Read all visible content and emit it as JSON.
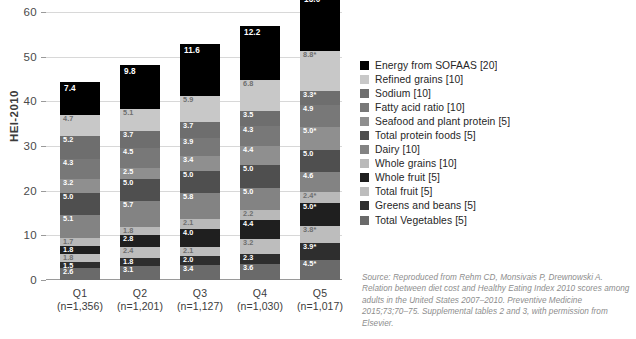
{
  "chart_data": {
    "type": "bar",
    "subtype": "stacked-bar",
    "title": "",
    "xlabel": "",
    "ylabel": "HEI-2010",
    "ylim": [
      0,
      60
    ],
    "yticks": [
      0,
      10,
      20,
      30,
      40,
      50,
      60
    ],
    "grid": true,
    "legend_position": "right",
    "categories": [
      "Q1",
      "Q2",
      "Q3",
      "Q4",
      "Q5"
    ],
    "category_sublabels": [
      "(n=1,356)",
      "(n=1,201)",
      "(n=1,127)",
      "(n=1,030)",
      "(n=1,017)"
    ],
    "stack_order_bottom_to_top": [
      "Total Vegetables [5]",
      "Greens and beans [5]",
      "Total fruit [5]",
      "Whole fruit [5]",
      "Whole grains [10]",
      "Dairy [10]",
      "Total protein foods [5]",
      "Seafood and plant protein [5]",
      "Fatty acid ratio [10]",
      "Sodium [10]",
      "Refined grains [10]",
      "Energy from SOFAAS [20]"
    ],
    "series": [
      {
        "name": "Energy from SOFAAS [20]",
        "color": "#000000",
        "values": [
          7.4,
          9.8,
          11.6,
          12.2,
          13.0
        ],
        "labels": [
          "7.4",
          "9.8",
          "11.6",
          "12.2",
          "13.0*"
        ]
      },
      {
        "name": "Refined grains [10]",
        "color": "#c8c8c8",
        "values": [
          4.7,
          5.1,
          5.9,
          6.8,
          8.8
        ],
        "labels": [
          "4.7",
          "5.1",
          "5.9",
          "6.8",
          "8.8*"
        ]
      },
      {
        "name": "Sodium [10]",
        "color": "#6e6e6e",
        "values": [
          5.2,
          3.7,
          3.7,
          3.5,
          3.3
        ],
        "labels": [
          "5.2",
          "3.7",
          "3.7",
          "3.5",
          "3.3*"
        ]
      },
      {
        "name": "Fatty acid ratio [10]",
        "color": "#787878",
        "values": [
          4.3,
          4.5,
          3.9,
          4.3,
          4.9
        ],
        "labels": [
          "4.3",
          "4.5",
          "3.9",
          "4.3",
          "4.9"
        ]
      },
      {
        "name": "Seafood and plant protein [5]",
        "color": "#8f8f8f",
        "values": [
          3.2,
          2.5,
          3.4,
          4.4,
          5.0
        ],
        "labels": [
          "3.2",
          "2.5",
          "3.4",
          "4.4",
          "5.0*"
        ]
      },
      {
        "name": "Total protein foods [5]",
        "color": "#4f4f4f",
        "values": [
          5.0,
          5.0,
          5.0,
          5.0,
          5.0
        ],
        "labels": [
          "5.0",
          "5.0",
          "5.0",
          "5.0",
          "5.0"
        ]
      },
      {
        "name": "Dairy [10]",
        "color": "#838383",
        "values": [
          5.1,
          5.7,
          5.8,
          5.0,
          4.6
        ],
        "labels": [
          "5.1",
          "5.7",
          "5.8",
          "5.0",
          "4.6"
        ]
      },
      {
        "name": "Whole grains [10]",
        "color": "#b9b9b9",
        "values": [
          1.7,
          1.8,
          2.1,
          2.2,
          2.4
        ],
        "labels": [
          "1.7",
          "1.8",
          "2.1",
          "2.2",
          "2.4*"
        ]
      },
      {
        "name": "Whole fruit [5]",
        "color": "#1f1f1f",
        "values": [
          1.8,
          2.8,
          4.0,
          4.4,
          5.0
        ],
        "labels": [
          "1.8",
          "2.8",
          "4.0",
          "4.4",
          "5.0*"
        ]
      },
      {
        "name": "Total fruit [5]",
        "color": "#bdbdbd",
        "values": [
          1.8,
          2.4,
          2.1,
          3.2,
          3.8
        ],
        "labels": [
          "1.8",
          "2.4",
          "2.1",
          "3.2",
          "3.8*"
        ]
      },
      {
        "name": "Greens and beans [5]",
        "color": "#2e2e2e",
        "values": [
          1.5,
          1.8,
          2.0,
          2.3,
          3.9
        ],
        "labels": [
          "1.5",
          "1.8",
          "2.0",
          "2.3",
          "3.9*"
        ]
      },
      {
        "name": "Total Vegetables [5]",
        "color": "#6a6a6a",
        "values": [
          2.6,
          3.1,
          3.4,
          3.6,
          4.5
        ],
        "labels": [
          "2.6",
          "3.1",
          "3.4",
          "3.6",
          "4.5*"
        ]
      }
    ],
    "totals": [
      44.3,
      48.2,
      52.9,
      56.9,
      64.2
    ]
  },
  "legend": {
    "items": [
      {
        "label": "Energy from SOFAAS [20]",
        "color": "#000000"
      },
      {
        "label": "Refined grains [10]",
        "color": "#c8c8c8"
      },
      {
        "label": "Sodium [10]",
        "color": "#6e6e6e"
      },
      {
        "label": "Fatty acid ratio [10]",
        "color": "#787878"
      },
      {
        "label": "Seafood and plant protein [5]",
        "color": "#8f8f8f"
      },
      {
        "label": "Total protein foods [5]",
        "color": "#4f4f4f"
      },
      {
        "label": "Dairy [10]",
        "color": "#838383"
      },
      {
        "label": "Whole grains [10]",
        "color": "#b9b9b9"
      },
      {
        "label": "Whole fruit [5]",
        "color": "#1f1f1f"
      },
      {
        "label": "Total fruit [5]",
        "color": "#bdbdbd"
      },
      {
        "label": "Greens and beans [5]",
        "color": "#2e2e2e"
      },
      {
        "label": "Total Vegetables [5]",
        "color": "#6a6a6a"
      }
    ]
  },
  "source_note": "Source: Reproduced from Rehm CD, Monsivais P, Drewnowski A. Relation between diet cost and Healthy Eating Index 2010 scores among adults in the United States 2007–2010. Preventive Medicine 2015;73;70–75. Supplemental tables 2 and 3, with permission from Elsevier."
}
